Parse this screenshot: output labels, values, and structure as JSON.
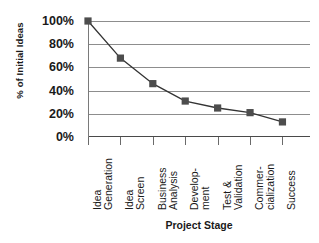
{
  "chart_data": {
    "type": "line",
    "title": "",
    "xlabel": "Project Stage",
    "ylabel": "% of Initial Ideas",
    "categories": [
      "Idea Generation",
      "Idea Screen",
      "Business Analysis",
      "Development",
      "Test & Validation",
      "Commercialization",
      "Success"
    ],
    "category_lines": [
      [
        "Idea",
        "Generation"
      ],
      [
        "Idea",
        "Screen"
      ],
      [
        "Business",
        "Analysis"
      ],
      [
        "Develop-",
        "ment"
      ],
      [
        "Test &",
        "Validation"
      ],
      [
        "Commer-",
        "cialization"
      ],
      [
        "Success"
      ]
    ],
    "values": [
      100,
      68,
      46,
      31,
      25,
      21,
      13
    ],
    "series": [
      {
        "name": "% of Initial Ideas",
        "values": [
          100,
          68,
          46,
          31,
          25,
          21,
          13
        ]
      }
    ],
    "ylim": [
      0,
      100
    ],
    "ytick_values": [
      100,
      80,
      60,
      40,
      20,
      0
    ],
    "ytick_labels": [
      "100%",
      "80%",
      "60%",
      "40%",
      "20%",
      "0%"
    ],
    "grid": true,
    "legend": "none",
    "marker": "square",
    "marker_color": "#4d4d4d",
    "line_color": "#333333",
    "grid_color": "#8d8d8d",
    "background": "#ffffff"
  }
}
